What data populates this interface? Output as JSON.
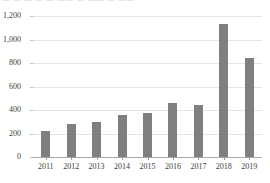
{
  "top_crop_strip": {
    "text": "— — —  — —   —— —  ——  — ——"
  },
  "colors": {
    "bar": "#7f7f7f",
    "gridline": "#e4e4e4",
    "baseline": "#a8a8a8",
    "text": "#3d3d3d",
    "background": "#ffffff"
  },
  "chart_data": {
    "type": "bar",
    "title": "",
    "subtitle": "",
    "xlabel": "",
    "ylabel": "",
    "categories": [
      "2011",
      "2012",
      "2013",
      "2014",
      "2015",
      "2016",
      "2017",
      "2018",
      "2019"
    ],
    "values": [
      220,
      280,
      300,
      360,
      375,
      460,
      445,
      1130,
      840
    ],
    "series": [
      {
        "name": "",
        "values": [
          220,
          280,
          300,
          360,
          375,
          460,
          445,
          1130,
          840
        ]
      }
    ],
    "ylim": [
      0,
      1200
    ],
    "ytick_values": [
      0,
      200,
      400,
      600,
      800,
      1000,
      1200
    ],
    "ytick_labels": [
      "0",
      "200",
      "400",
      "600",
      "800",
      "1,000",
      "1,200"
    ],
    "grid": true,
    "grid_axis": "y",
    "legend": false,
    "legend_position": "none",
    "orientation": "vertical",
    "bar_color": "#7f7f7f"
  }
}
